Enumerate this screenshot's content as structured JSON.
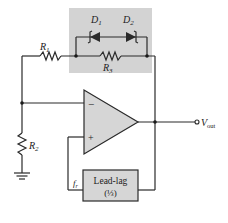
{
  "diagram": {
    "colors": {
      "background": "#ffffff",
      "wire": "#2a2a2a",
      "shade": "#d3d3d3",
      "component_fill": "#d6d6d6"
    },
    "components": {
      "r1": {
        "label": "R",
        "sub": "1"
      },
      "r2": {
        "label": "R",
        "sub": "2"
      },
      "r3": {
        "label": "R",
        "sub": "3"
      },
      "d1": {
        "label": "D",
        "sub": "1"
      },
      "d2": {
        "label": "D",
        "sub": "2"
      },
      "opamp": {
        "minus": "−",
        "plus": "+"
      },
      "lead_lag": {
        "line1": "Lead-lag",
        "line2": "(⅓)"
      },
      "fr": {
        "label": "f",
        "sub": "r"
      },
      "vout": {
        "label": "V",
        "sub": "out"
      }
    }
  }
}
